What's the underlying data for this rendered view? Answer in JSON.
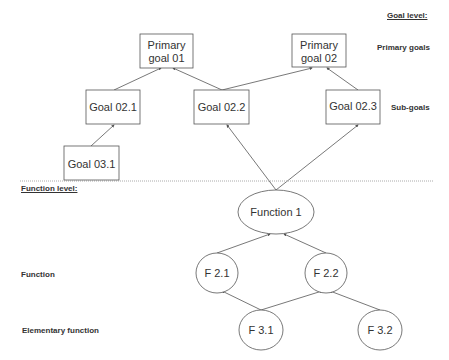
{
  "levels": {
    "goal_level": "Goal level:",
    "function_level": "Function level:"
  },
  "categories": {
    "primary_goals": "Primary goals",
    "sub_goals": "Sub-goals",
    "function": "Function",
    "elementary_function": "Elementary function"
  },
  "nodes": {
    "pg01": {
      "line1": "Primary",
      "line2": "goal 01"
    },
    "pg02": {
      "line1": "Primary",
      "line2": "goal 02"
    },
    "g021": "Goal 02.1",
    "g022": "Goal 02.2",
    "g023": "Goal 02.3",
    "g031": "Goal 03.1",
    "f1": "Function 1",
    "f21": "F 2.1",
    "f22": "F 2.2",
    "f31": "F 3.1",
    "f32": "F 3.2"
  },
  "edges": [
    [
      "g031",
      "g021"
    ],
    [
      "g021",
      "pg01"
    ],
    [
      "g022",
      "pg01"
    ],
    [
      "g022",
      "pg02"
    ],
    [
      "g023",
      "pg02"
    ],
    [
      "f1",
      "g022"
    ],
    [
      "f1",
      "g023"
    ],
    [
      "f21",
      "f1"
    ],
    [
      "f22",
      "f1"
    ],
    [
      "f31",
      "f21"
    ],
    [
      "f31",
      "f22"
    ],
    [
      "f32",
      "f22"
    ]
  ],
  "colors": {
    "stroke": "#555555",
    "text": "#333333",
    "divider": "#aaaaaa"
  }
}
